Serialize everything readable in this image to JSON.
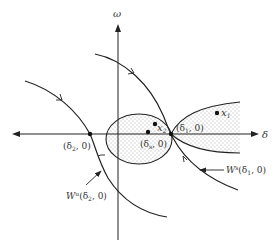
{
  "diagram": {
    "axes": {
      "x_label": "δ",
      "y_label": "ω"
    },
    "points": {
      "delta2": {
        "label_open": "(δ",
        "label_sub": "2",
        "label_close": ", 0)"
      },
      "deltas": {
        "label_open": "(δ",
        "label_sub": "s",
        "label_close": ", 0)"
      },
      "delta1": {
        "label_open": "(δ",
        "label_sub": "1",
        "label_close": ", 0)"
      },
      "x1": {
        "label": "x",
        "label_sub": "1"
      },
      "x2": {
        "label": "x",
        "label_sub": "2"
      }
    },
    "manifolds": {
      "stable": {
        "label_main": "W",
        "label_sup": "s",
        "label_args_open": "(δ",
        "label_sub": "1",
        "label_args_close": ", 0)"
      },
      "unstable": {
        "label_main": "W",
        "label_sup": "u",
        "label_args_open": "(δ",
        "label_sub": "2",
        "label_args_close": ", 0)"
      }
    },
    "colors": {
      "line": "#222222",
      "stipple": "#555555",
      "background": "#ffffff"
    }
  }
}
